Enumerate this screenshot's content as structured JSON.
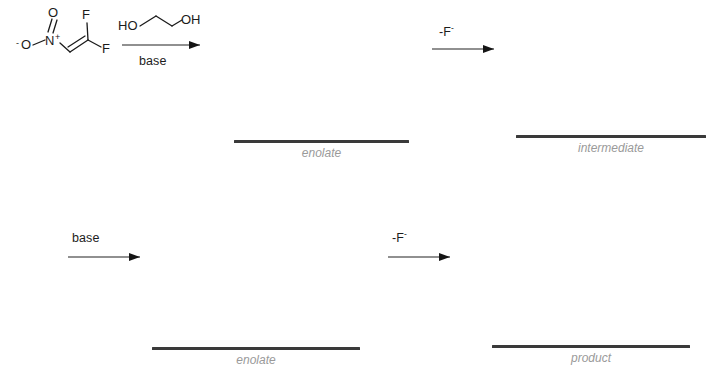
{
  "scheme": {
    "title": "Nitro-difluoroalkene reaction scheme",
    "background_color": "#ffffff",
    "line_color": "#232323",
    "caption_color": "#9a9a9a",
    "bar_color": "#3a3a3a"
  },
  "reactant": {
    "name": "1,1-difluoro-2-nitroethene",
    "atoms": {
      "o_minus": "O",
      "o_minus_charge": "-",
      "n_plus": "N",
      "n_plus_charge": "+",
      "o_double": "O",
      "f_top": "F",
      "f_bottom": "F"
    }
  },
  "steps": [
    {
      "id": "step-1",
      "reagent_above": "HO",
      "reagent_above_2": "OH",
      "reagent_name": "ethylene glycol",
      "condition_below": "base"
    },
    {
      "id": "step-2",
      "condition_above": "-F",
      "condition_above_sup": "-"
    },
    {
      "id": "step-3",
      "condition_above": "base"
    },
    {
      "id": "step-4",
      "condition_above": "-F",
      "condition_above_sup": "-"
    }
  ],
  "structures": [
    {
      "id": "enolate-1",
      "caption": "enolate"
    },
    {
      "id": "intermediate",
      "caption": "intermediate"
    },
    {
      "id": "enolate-2",
      "caption": "enolate"
    },
    {
      "id": "product",
      "caption": "product"
    }
  ]
}
